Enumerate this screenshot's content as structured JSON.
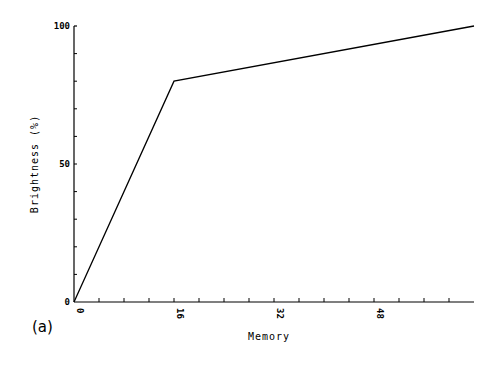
{
  "chart_data": {
    "type": "line",
    "title": "",
    "panel_label": "(a)",
    "xlabel": "Memory",
    "ylabel": "Brightness (%)",
    "xlim": [
      0,
      64
    ],
    "ylim": [
      0,
      100
    ],
    "x_ticks": [
      0,
      16,
      32,
      48
    ],
    "x_minor_tick_step": 4,
    "y_ticks": [
      0,
      50,
      100
    ],
    "y_minor_tick_step": 10,
    "grid": false,
    "legend": null,
    "series": [
      {
        "name": "brightness",
        "x": [
          0,
          16,
          64
        ],
        "y": [
          0,
          80,
          100
        ],
        "color": "#000000"
      }
    ]
  },
  "labels": {
    "panel": "(a)",
    "xlabel": "Memory",
    "ylabel": "Brightness (%)",
    "x_ticks": [
      "0",
      "16",
      "32",
      "48"
    ],
    "y_ticks": [
      "0",
      "50",
      "100"
    ]
  }
}
